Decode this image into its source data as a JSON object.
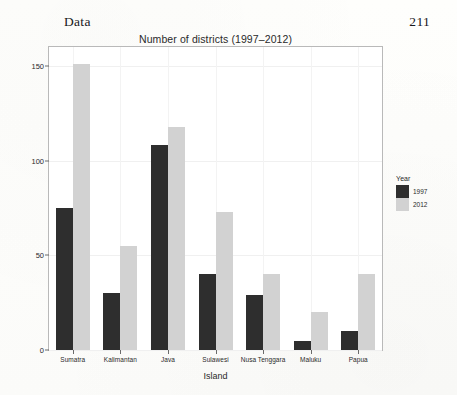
{
  "page": {
    "running_head": "Data",
    "page_number": "211"
  },
  "legend": {
    "title": "Year",
    "position": "right"
  },
  "colors": {
    "bar_1997": "#2e2e2e",
    "bar_2012": "#d2d2d2",
    "panel_background": "#ffffff",
    "panel_border": "#b9b9b9",
    "gridline": "#f0f0f0",
    "page_background": "#fdfdfb"
  },
  "chart_data": {
    "type": "bar",
    "title": "Number of districts (1997–2012)",
    "xlabel": "Island",
    "ylabel": "Number of districts/municipalities",
    "categories": [
      "Sumatra",
      "Kalimantan",
      "Java",
      "Sulawesi",
      "Nusa Tenggara",
      "Maluku",
      "Papua"
    ],
    "series": [
      {
        "name": "1997",
        "color": "#2e2e2e",
        "values": [
          75,
          30,
          108,
          40,
          29,
          5,
          10
        ]
      },
      {
        "name": "2012",
        "color": "#d2d2d2",
        "values": [
          151,
          55,
          118,
          73,
          40,
          20,
          40
        ]
      }
    ],
    "ylim": [
      0,
      160
    ],
    "yticks": [
      0,
      50,
      100,
      150
    ],
    "ytick_labels": [
      "0",
      "50",
      "100",
      "150"
    ],
    "grid": true,
    "legend_position": "right"
  }
}
